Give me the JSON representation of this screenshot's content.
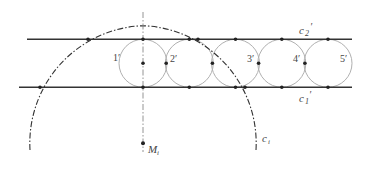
{
  "diagram": {
    "colors": {
      "line": "#333333",
      "circle": "#aaaaaa",
      "dot": "#222222",
      "text": "#444444"
    },
    "lines": [
      {
        "name": "c2-prime",
        "y": 39.3,
        "x1": 27,
        "x2": 352
      },
      {
        "name": "c1-prime",
        "y": 87.3,
        "x1": 19,
        "x2": 352
      }
    ],
    "circles": [
      {
        "label": "1'",
        "cx": 143,
        "cy": 63.3,
        "r": 24
      },
      {
        "label": "2'",
        "cx": 189.3,
        "cy": 63.3,
        "r": 24
      },
      {
        "label": "3'",
        "cx": 235.5,
        "cy": 63.3,
        "r": 24
      },
      {
        "label": "4'",
        "cx": 281.8,
        "cy": 63.3,
        "r": 24
      },
      {
        "label": "5'",
        "cx": 328,
        "cy": 63.3,
        "r": 24
      }
    ],
    "big_circle": {
      "label": "c_i",
      "cx": 143,
      "cy": 143.3,
      "r": 117.6
    },
    "center_point": {
      "label": "M_i",
      "x": 143,
      "y": 143.3
    },
    "labels": {
      "c2": "c",
      "c2_sub": "2",
      "c2_prime": "′",
      "c1": "c",
      "c1_sub": "1",
      "c1_prime": "′",
      "ci": "c",
      "ci_sub": "i",
      "mi": "M",
      "mi_sub": "i",
      "n1": "1′",
      "n2": "2′",
      "n3": "3′",
      "n4": "4′",
      "n5": "5′"
    }
  }
}
